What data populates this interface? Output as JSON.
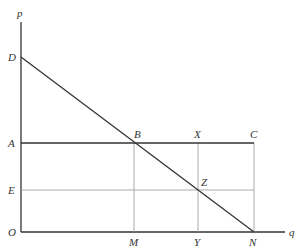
{
  "figure": {
    "caption_partial": "",
    "axes": {
      "y_label": "p",
      "x_label": "q",
      "origin_label": "O"
    },
    "points": {
      "D": {
        "label": "D",
        "x": 21,
        "y": 57
      },
      "A": {
        "label": "A",
        "x": 21,
        "y": 143
      },
      "E": {
        "label": "E",
        "x": 21,
        "y": 190
      },
      "O": {
        "label": "O",
        "x": 21,
        "y": 232
      },
      "B": {
        "label": "B",
        "x": 134,
        "y": 143
      },
      "X": {
        "label": "X",
        "x": 198,
        "y": 143
      },
      "C": {
        "label": "C",
        "x": 254,
        "y": 143
      },
      "Z": {
        "label": "Z",
        "x": 198,
        "y": 190
      },
      "M": {
        "label": "M",
        "x": 134,
        "y": 232
      },
      "Y": {
        "label": "Y",
        "x": 198,
        "y": 232
      },
      "N": {
        "label": "N",
        "x": 254,
        "y": 232
      }
    },
    "lines": [
      {
        "from": "D",
        "to": "N",
        "style": "dark"
      },
      {
        "from": "A",
        "to": "C",
        "style": "dark"
      },
      {
        "from": "E",
        "to": "Z",
        "style": "light"
      },
      {
        "from": "B",
        "to": "M",
        "style": "light"
      },
      {
        "from": "X",
        "to": "Y",
        "style": "light"
      },
      {
        "from": "C",
        "to": "N",
        "style": "light"
      }
    ],
    "colors": {
      "dark_line": "#333333",
      "light_line": "#999999",
      "label": "#333333"
    }
  }
}
